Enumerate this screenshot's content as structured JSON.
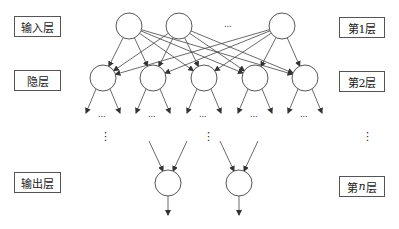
{
  "diagram": {
    "type": "neural-network",
    "left_labels": [
      {
        "id": "input",
        "text": "输入层",
        "x": 14,
        "y": 16,
        "w": 47,
        "h": 21
      },
      {
        "id": "hidden",
        "text": "隐层",
        "x": 14,
        "y": 70,
        "w": 47,
        "h": 21
      },
      {
        "id": "output",
        "text": "输出层",
        "x": 14,
        "y": 172,
        "w": 47,
        "h": 21
      }
    ],
    "right_labels": [
      {
        "id": "layer1",
        "text": "第1层",
        "x": 339,
        "y": 17,
        "w": 46,
        "h": 21
      },
      {
        "id": "layer2",
        "text": "第2层",
        "x": 339,
        "y": 71,
        "w": 46,
        "h": 21
      },
      {
        "id": "layern",
        "text": "第n层",
        "x": 339,
        "y": 176,
        "w": 46,
        "h": 21
      }
    ],
    "ellipsis": "...",
    "vertical_ellipsis": "⋮",
    "node_radius": 13,
    "input_nodes": [
      [
        129,
        26
      ],
      [
        179,
        26
      ],
      [
        282,
        26
      ]
    ],
    "hidden_nodes": [
      [
        103,
        78
      ],
      [
        153,
        78
      ],
      [
        204,
        78
      ],
      [
        255,
        78
      ],
      [
        305,
        78
      ]
    ],
    "output_nodes": [
      [
        168,
        183
      ],
      [
        239,
        183
      ]
    ],
    "stroke_color": "#444444"
  }
}
